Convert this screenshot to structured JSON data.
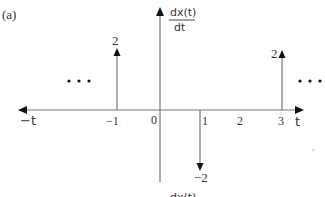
{
  "figure": {
    "panel_label": "(a)",
    "y_axis_label_numerator": "dx(t)",
    "y_axis_label_denominator": "dt",
    "x_axis_label_pos": "t",
    "x_axis_label_neg": "−t",
    "bottom_cutoff_text": "dx(t)",
    "ellipsis_left": "•  •  •",
    "ellipsis_right": "•  •  •",
    "ticks": [
      {
        "label": "−1",
        "t": -1
      },
      {
        "label": "0",
        "t": 0
      },
      {
        "label": "1",
        "t": 1
      },
      {
        "label": "2",
        "t": 2
      },
      {
        "label": "3",
        "t": 3
      }
    ],
    "impulses": [
      {
        "t": -1,
        "weight": 2,
        "label": "2"
      },
      {
        "t": 1,
        "weight": -2,
        "label": "−2"
      },
      {
        "t": 3,
        "weight": 2,
        "label": "2"
      }
    ],
    "colors": {
      "line": "#777777",
      "arrow": "#111111",
      "text": "#333333"
    }
  }
}
